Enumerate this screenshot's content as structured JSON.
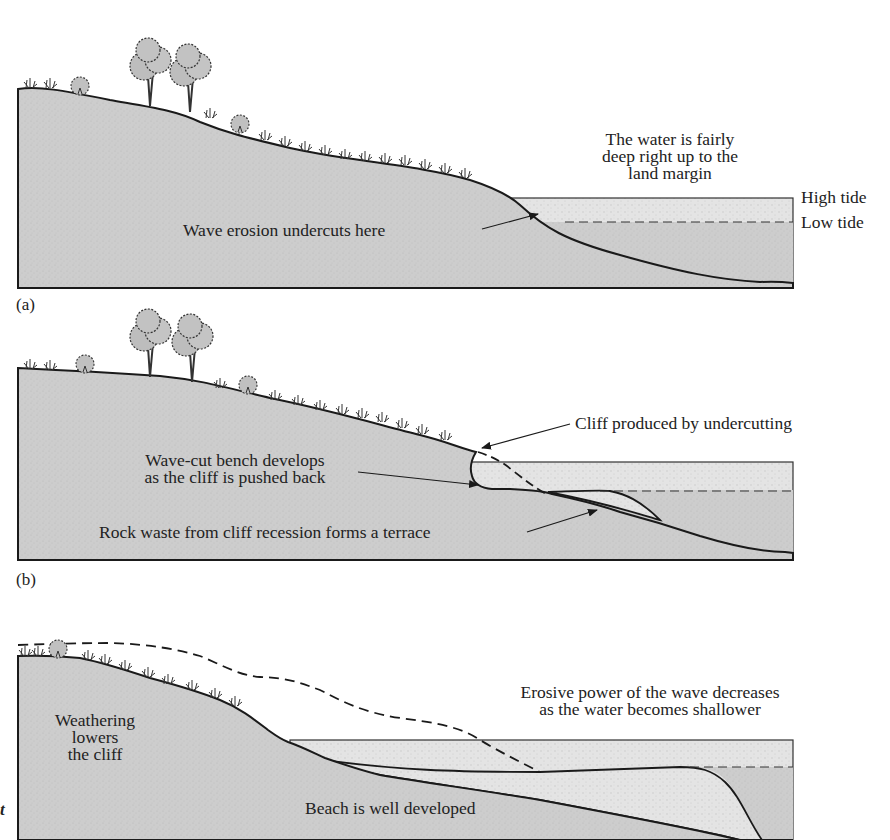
{
  "diagram": {
    "colors": {
      "land": "#cfcfcf",
      "water": "#e6e6e6",
      "terrace": "#e2e2e2",
      "outline": "#1a1a1a",
      "text": "#222222"
    },
    "panels": [
      {
        "tag": "(a)",
        "labels": {
          "water_note_line1": "The water is fairly",
          "water_note_line2": "deep right up to the",
          "water_note_line3": "land margin",
          "high_tide": "High tide",
          "low_tide": "Low tide",
          "undercut": "Wave erosion undercuts here"
        }
      },
      {
        "tag": "(b)",
        "labels": {
          "cliff": "Cliff produced by undercutting",
          "bench_line1": "Wave-cut bench develops",
          "bench_line2": "as the cliff is pushed back",
          "terrace": "Rock waste from cliff recession forms a terrace"
        }
      },
      {
        "tag": "t",
        "labels": {
          "weathering_line1": "Weathering",
          "weathering_line2": "lowers",
          "weathering_line3": "the cliff",
          "erosive_line1": "Erosive power of the wave decreases",
          "erosive_line2": "as the water becomes shallower",
          "beach": "Beach is well developed"
        }
      }
    ]
  }
}
